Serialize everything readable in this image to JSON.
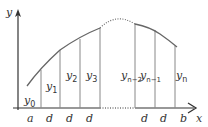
{
  "diagram": {
    "type": "trapezoid/Simpson rule partition of area under a curve",
    "axes": {
      "x_label": "x",
      "y_label": "y"
    },
    "ordinates": [
      {
        "name": "y",
        "sub": "0"
      },
      {
        "name": "y",
        "sub": "1"
      },
      {
        "name": "y",
        "sub": "2"
      },
      {
        "name": "y",
        "sub": "3"
      },
      {
        "name": "y",
        "sub": "n−2"
      },
      {
        "name": "y",
        "sub": "n−1"
      },
      {
        "name": "y",
        "sub": "n"
      }
    ],
    "x_tick_labels": [
      "a",
      "d",
      "d",
      "d",
      "d",
      "d",
      "b"
    ],
    "colors": {
      "line": "#333333",
      "ordinate": "#888888",
      "curve": "#666666",
      "background": "#ffffff"
    }
  }
}
